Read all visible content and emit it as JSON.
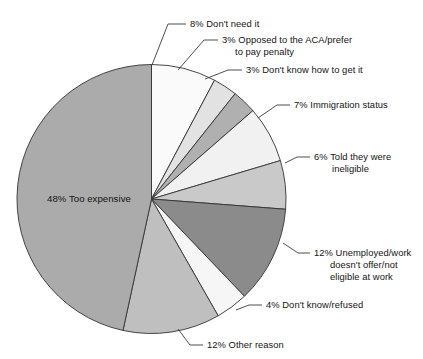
{
  "chart_data": {
    "type": "pie",
    "title": "",
    "subtitle": "",
    "xlabel": "",
    "ylabel": "",
    "legend_position": "none",
    "grid": false,
    "units": "percent",
    "start_angle_deg": 0,
    "direction": "clockwise",
    "categories": [
      "Don't need it",
      "Opposed to the ACA/prefer to pay penalty",
      "Don't know how to get it",
      "Immigration status",
      "Told they were ineligible",
      "Unemployed/work doesn't offer/not eligible at work",
      "Don't know/refused",
      "Other reason",
      "Too expensive"
    ],
    "values": [
      8,
      3,
      3,
      7,
      6,
      12,
      4,
      12,
      48
    ],
    "colors": [
      "#fafafa",
      "#e2e2e2",
      "#b0b0b0",
      "#f1f1f1",
      "#c9c9c9",
      "#8b8b8b",
      "#f6f6f6",
      "#bfbfbf",
      "#ababab"
    ],
    "slices": [
      {
        "label": "Don't need it",
        "value": 8,
        "percent_text": "8%",
        "full_label": "8% Don't need it",
        "color": "#fafafa",
        "label_lines": [
          "8% Don't need it"
        ]
      },
      {
        "label": "Opposed to the ACA/prefer to pay penalty",
        "value": 3,
        "percent_text": "3%",
        "full_label": "3% Opposed to the ACA/prefer to pay penalty",
        "color": "#e2e2e2",
        "label_lines": [
          "3% Opposed to the ACA/prefer",
          "to pay penalty"
        ]
      },
      {
        "label": "Don't know how to get it",
        "value": 3,
        "percent_text": "3%",
        "full_label": "3% Don't know how to get it",
        "color": "#b0b0b0",
        "label_lines": [
          "3% Don't know how to get it"
        ]
      },
      {
        "label": "Immigration status",
        "value": 7,
        "percent_text": "7%",
        "full_label": "7% Immigration status",
        "color": "#f1f1f1",
        "label_lines": [
          "7% Immigration status"
        ]
      },
      {
        "label": "Told they were ineligible",
        "value": 6,
        "percent_text": "6%",
        "full_label": "6% Told they were ineligible",
        "color": "#c9c9c9",
        "label_lines": [
          "6% Told they were",
          "ineligible"
        ]
      },
      {
        "label": "Unemployed/work doesn't offer/not eligible at work",
        "value": 12,
        "percent_text": "12%",
        "full_label": "12% Unemployed/work doesn't offer/not eligible at work",
        "color": "#8b8b8b",
        "label_lines": [
          "12% Unemployed/work",
          "doesn't offer/not",
          "eligible at work"
        ]
      },
      {
        "label": "Don't know/refused",
        "value": 4,
        "percent_text": "4%",
        "full_label": "4% Don't know/refused",
        "color": "#f6f6f6",
        "label_lines": [
          "4% Don't know/refused"
        ]
      },
      {
        "label": "Other reason",
        "value": 12,
        "percent_text": "12%",
        "full_label": "12% Other reason",
        "color": "#bfbfbf",
        "label_lines": [
          "12% Other reason"
        ]
      },
      {
        "label": "Too expensive",
        "value": 48,
        "percent_text": "48%",
        "full_label": "48% Too expensive",
        "color": "#ababab",
        "label_lines": [
          "48% Too expensive"
        ],
        "label_placement": "inside"
      }
    ]
  },
  "labels": {
    "dont_need_it": "8% Don't need it",
    "opposed_line1": "3% Opposed to the ACA/prefer",
    "opposed_line2": "to pay penalty",
    "dont_know_how": "3% Don't know how to get it",
    "immigration": "7% Immigration status",
    "ineligible_line1": "6% Told they were",
    "ineligible_line2": "ineligible",
    "unemployed_line1": "12% Unemployed/work",
    "unemployed_line2": "doesn't offer/not",
    "unemployed_line3": "eligible at work",
    "dont_know_refused": "4% Don't know/refused",
    "other_reason": "12% Other reason",
    "too_expensive": "48% Too expensive"
  }
}
